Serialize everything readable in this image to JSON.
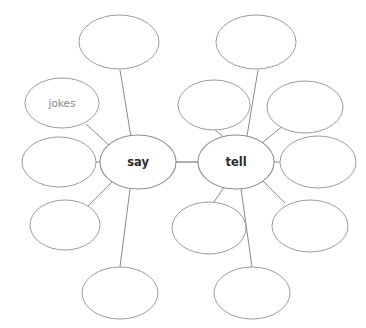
{
  "worksheet": {
    "type": "word-web",
    "background_color": "#ffffff",
    "stroke_color": "#9c9c9c",
    "central_text_color": "#2b2b2b",
    "satellite_text_color": "#8a8a8a",
    "clusters": [
      {
        "id": "say-cluster",
        "center": {
          "label": "say",
          "cx": 138,
          "cy": 162,
          "rx": 38,
          "ry": 27
        },
        "satellites": [
          {
            "id": "say-top",
            "label": "",
            "cx": 119,
            "cy": 42,
            "rx": 40,
            "ry": 27
          },
          {
            "id": "say-upper-left",
            "label": "jokes",
            "cx": 62,
            "cy": 103,
            "rx": 37,
            "ry": 25
          },
          {
            "id": "say-left",
            "label": "",
            "cx": 59,
            "cy": 162,
            "rx": 37,
            "ry": 25
          },
          {
            "id": "say-lower-left",
            "label": "",
            "cx": 65,
            "cy": 225,
            "rx": 35,
            "ry": 25
          },
          {
            "id": "say-bottom",
            "label": "",
            "cx": 120,
            "cy": 293,
            "rx": 38,
            "ry": 26
          }
        ]
      },
      {
        "id": "tell-cluster",
        "center": {
          "label": "tell",
          "cx": 236,
          "cy": 162,
          "rx": 38,
          "ry": 27
        },
        "satellites": [
          {
            "id": "tell-top",
            "label": "",
            "cx": 256,
            "cy": 42,
            "rx": 40,
            "ry": 27
          },
          {
            "id": "tell-upper-left",
            "label": "",
            "cx": 214,
            "cy": 105,
            "rx": 36,
            "ry": 25
          },
          {
            "id": "tell-upper-right",
            "label": "",
            "cx": 305,
            "cy": 107,
            "rx": 38,
            "ry": 26
          },
          {
            "id": "tell-right",
            "label": "",
            "cx": 318,
            "cy": 162,
            "rx": 38,
            "ry": 26
          },
          {
            "id": "tell-lower-right",
            "label": "",
            "cx": 310,
            "cy": 226,
            "rx": 38,
            "ry": 26
          },
          {
            "id": "tell-lower-left",
            "label": "",
            "cx": 209,
            "cy": 228,
            "rx": 37,
            "ry": 26
          },
          {
            "id": "tell-bottom",
            "label": "",
            "cx": 252,
            "cy": 293,
            "rx": 38,
            "ry": 26
          }
        ]
      }
    ],
    "bridge": {
      "id": "say-tell-bridge",
      "x1": 176,
      "y1": 162,
      "x2": 198,
      "y2": 162
    },
    "spokes": [
      {
        "id": "spoke-say-top",
        "x1": 131,
        "y1": 137,
        "x2": 120,
        "y2": 70
      },
      {
        "id": "spoke-say-upper-left",
        "x1": 110,
        "y1": 146,
        "x2": 86,
        "y2": 124
      },
      {
        "id": "spoke-say-left",
        "x1": 100,
        "y1": 162,
        "x2": 95,
        "y2": 162
      },
      {
        "id": "spoke-say-lower-left",
        "x1": 112,
        "y1": 182,
        "x2": 88,
        "y2": 206
      },
      {
        "id": "spoke-say-bottom",
        "x1": 130,
        "y1": 189,
        "x2": 120,
        "y2": 267
      },
      {
        "id": "spoke-tell-top",
        "x1": 247,
        "y1": 136,
        "x2": 258,
        "y2": 70
      },
      {
        "id": "spoke-tell-upper-left",
        "x1": 225,
        "y1": 138,
        "x2": 215,
        "y2": 130
      },
      {
        "id": "spoke-tell-upper-right",
        "x1": 258,
        "y1": 146,
        "x2": 283,
        "y2": 126
      },
      {
        "id": "spoke-tell-right",
        "x1": 274,
        "y1": 162,
        "x2": 280,
        "y2": 162
      },
      {
        "id": "spoke-tell-lower-right",
        "x1": 262,
        "y1": 180,
        "x2": 285,
        "y2": 203
      },
      {
        "id": "spoke-tell-lower-left",
        "x1": 224,
        "y1": 187,
        "x2": 214,
        "y2": 202
      },
      {
        "id": "spoke-tell-bottom",
        "x1": 241,
        "y1": 189,
        "x2": 252,
        "y2": 267
      }
    ]
  }
}
